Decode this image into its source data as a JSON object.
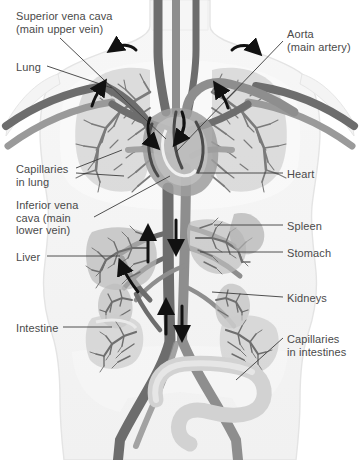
{
  "figure": {
    "type": "anatomical-diagram",
    "palette": {
      "background": "#ffffff",
      "body_fill": "#f4f4f4",
      "body_outline": "#e2e2e2",
      "vein_dark": "#6d6d6d",
      "artery_mid": "#8e8e8e",
      "organ_light": "#c9c9c9",
      "organ_mid": "#a8a8a8",
      "capillary": "#7a7a7a",
      "arrow": "#111111",
      "label_text": "#4a4a4a",
      "leader_line": "#3c3c3c"
    }
  },
  "labels": [
    {
      "id": "superior-vena-cava",
      "lines": [
        "Superior vena cava",
        "(main upper vein)"
      ],
      "side": "left",
      "x": 16,
      "y": 10
    },
    {
      "id": "lung",
      "lines": [
        "Lung"
      ],
      "side": "left",
      "x": 16,
      "y": 61
    },
    {
      "id": "capillaries-lung",
      "lines": [
        "Capillaries",
        "in lung"
      ],
      "side": "left",
      "x": 16,
      "y": 163
    },
    {
      "id": "inferior-vena-cava",
      "lines": [
        "Inferior vena",
        "cava (main",
        "lower vein)"
      ],
      "side": "left",
      "x": 16,
      "y": 199
    },
    {
      "id": "liver",
      "lines": [
        "Liver"
      ],
      "side": "left",
      "x": 16,
      "y": 251
    },
    {
      "id": "intestine",
      "lines": [
        "Intestine"
      ],
      "side": "left",
      "x": 16,
      "y": 322
    },
    {
      "id": "aorta",
      "lines": [
        "Aorta",
        "(main artery)"
      ],
      "side": "right",
      "x": 287,
      "y": 28
    },
    {
      "id": "heart",
      "lines": [
        "Heart"
      ],
      "side": "right",
      "x": 287,
      "y": 168
    },
    {
      "id": "spleen",
      "lines": [
        "Spleen"
      ],
      "side": "right",
      "x": 287,
      "y": 220
    },
    {
      "id": "stomach",
      "lines": [
        "Stomach"
      ],
      "side": "right",
      "x": 287,
      "y": 247
    },
    {
      "id": "kidneys",
      "lines": [
        "Kidneys"
      ],
      "side": "right",
      "x": 287,
      "y": 292
    },
    {
      "id": "capillaries-intestines",
      "lines": [
        "Capillaries",
        "in intestines"
      ],
      "side": "right",
      "x": 287,
      "y": 333
    }
  ],
  "leaders": [
    {
      "id": "leader-superior-vena-cava",
      "x1": 60,
      "y1": 38,
      "x2": 166,
      "y2": 139
    },
    {
      "id": "leader-lung",
      "x1": 47,
      "y1": 66,
      "x2": 112,
      "y2": 88
    },
    {
      "id": "leader-capillaries-lung",
      "x1": 76,
      "y1": 168,
      "x2": 122,
      "y2": 150
    },
    {
      "id": "leader-capillaries-lung-2",
      "x1": 76,
      "y1": 173,
      "x2": 124,
      "y2": 176
    },
    {
      "id": "leader-inferior-vena-cava",
      "x1": 94,
      "y1": 217,
      "x2": 170,
      "y2": 176
    },
    {
      "id": "leader-liver",
      "x1": 47,
      "y1": 256,
      "x2": 120,
      "y2": 256
    },
    {
      "id": "leader-intestine",
      "x1": 63,
      "y1": 327,
      "x2": 112,
      "y2": 327
    },
    {
      "id": "leader-aorta",
      "x1": 283,
      "y1": 41,
      "x2": 176,
      "y2": 152
    },
    {
      "id": "leader-heart",
      "x1": 283,
      "y1": 173,
      "x2": 196,
      "y2": 173
    },
    {
      "id": "leader-spleen",
      "x1": 283,
      "y1": 225,
      "x2": 214,
      "y2": 225
    },
    {
      "id": "leader-stomach",
      "x1": 283,
      "y1": 252,
      "x2": 200,
      "y2": 252
    },
    {
      "id": "leader-kidneys",
      "x1": 283,
      "y1": 297,
      "x2": 212,
      "y2": 292
    },
    {
      "id": "leader-capillaries-intestines",
      "x1": 283,
      "y1": 338,
      "x2": 236,
      "y2": 380
    }
  ],
  "flow_arrows": [
    {
      "id": "arrow-upper-left",
      "x": 124,
      "y": 47,
      "dir": "left"
    },
    {
      "id": "arrow-upper-right",
      "x": 244,
      "y": 47,
      "dir": "right"
    },
    {
      "id": "arrow-lung-left",
      "x": 96,
      "y": 96,
      "dir": "up"
    },
    {
      "id": "arrow-lung-right",
      "x": 224,
      "y": 98,
      "dir": "up"
    },
    {
      "id": "arrow-heart-in",
      "x": 152,
      "y": 128,
      "dir": "down"
    },
    {
      "id": "arrow-heart-out",
      "x": 186,
      "y": 122,
      "dir": "down"
    },
    {
      "id": "arrow-aorta-down",
      "x": 176,
      "y": 236,
      "dir": "down"
    },
    {
      "id": "arrow-vena-up",
      "x": 148,
      "y": 244,
      "dir": "up"
    },
    {
      "id": "arrow-abdomen-up",
      "x": 166,
      "y": 318,
      "dir": "up"
    },
    {
      "id": "arrow-abdomen-dn",
      "x": 182,
      "y": 318,
      "dir": "down"
    }
  ]
}
